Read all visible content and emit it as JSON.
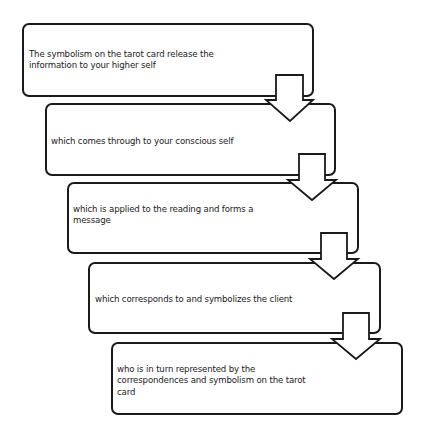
{
  "diagram": {
    "type": "flowchart",
    "direction": "top-to-bottom, staircase offset right",
    "colors": {
      "stroke": "#1a1a1a",
      "fill": "#ffffff",
      "text": "#222222",
      "background": "#ffffff"
    },
    "steps": [
      {
        "id": 1,
        "text": "The symbolism on the tarot card release the\ninformation to your higher self"
      },
      {
        "id": 2,
        "text": "which comes through to your conscious self"
      },
      {
        "id": 3,
        "text": "which is applied to the reading and forms a\nmessage"
      },
      {
        "id": 4,
        "text": "which corresponds to and symbolizes the client"
      },
      {
        "id": 5,
        "text": "who is in turn represented by the\ncorrespondences and symbolism on the tarot\ncard"
      }
    ],
    "connectors": [
      {
        "from": 1,
        "to": 2,
        "icon": "down-arrow-icon"
      },
      {
        "from": 2,
        "to": 3,
        "icon": "down-arrow-icon"
      },
      {
        "from": 3,
        "to": 4,
        "icon": "down-arrow-icon"
      },
      {
        "from": 4,
        "to": 5,
        "icon": "down-arrow-icon"
      }
    ]
  }
}
